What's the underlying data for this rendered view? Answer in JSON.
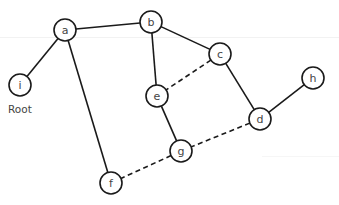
{
  "diagram": {
    "type": "graph",
    "root_label": "Root",
    "nodes": [
      {
        "id": "a",
        "label": "a",
        "x": 65,
        "y": 30
      },
      {
        "id": "b",
        "label": "b",
        "x": 151,
        "y": 22
      },
      {
        "id": "c",
        "label": "c",
        "x": 220,
        "y": 54
      },
      {
        "id": "d",
        "label": "d",
        "x": 260,
        "y": 119
      },
      {
        "id": "e",
        "label": "e",
        "x": 157,
        "y": 96
      },
      {
        "id": "f",
        "label": "f",
        "x": 111,
        "y": 183
      },
      {
        "id": "g",
        "label": "g",
        "x": 181,
        "y": 151
      },
      {
        "id": "h",
        "label": "h",
        "x": 313,
        "y": 78
      },
      {
        "id": "i",
        "label": "i",
        "x": 20,
        "y": 85
      }
    ],
    "edges": [
      {
        "from": "a",
        "to": "b",
        "style": "solid"
      },
      {
        "from": "a",
        "to": "i",
        "style": "solid"
      },
      {
        "from": "a",
        "to": "f",
        "style": "solid"
      },
      {
        "from": "b",
        "to": "c",
        "style": "solid"
      },
      {
        "from": "b",
        "to": "e",
        "style": "solid"
      },
      {
        "from": "c",
        "to": "d",
        "style": "solid"
      },
      {
        "from": "c",
        "to": "e",
        "style": "dashed"
      },
      {
        "from": "d",
        "to": "h",
        "style": "solid"
      },
      {
        "from": "d",
        "to": "g",
        "style": "dashed"
      },
      {
        "from": "e",
        "to": "g",
        "style": "solid"
      },
      {
        "from": "g",
        "to": "f",
        "style": "dashed"
      }
    ],
    "node_radius": 11,
    "colors": {
      "stroke": "#1a1a1a",
      "label": "#444444",
      "background": "#ffffff"
    }
  }
}
